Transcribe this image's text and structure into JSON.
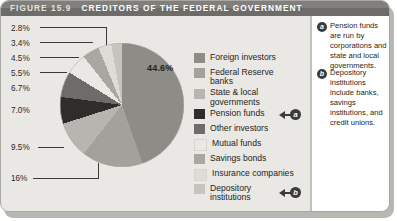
{
  "figure": {
    "label": "FIGURE 15.9",
    "title": "CREDITORS OF THE FEDERAL GOVERNMENT",
    "source": "Source: U. S. Treasury Bulletin, December 2005"
  },
  "chart_data": {
    "type": "pie",
    "title": "CREDITORS OF THE FEDERAL GOVERNMENT",
    "legend_position": "right",
    "categories": [
      "Foreign investors",
      "Federal Reserve banks",
      "State & local governments",
      "Pension funds",
      "Other investors",
      "Mutual funds",
      "Savings bonds",
      "Insurance companies",
      "Depository institutions"
    ],
    "values": [
      44.6,
      16,
      9.5,
      7.0,
      6.7,
      5.5,
      4.5,
      3.4,
      2.8
    ],
    "value_labels": [
      "44.6%",
      "16%",
      "9.5%",
      "7.0%",
      "6.7%",
      "5.5%",
      "4.5%",
      "3.4%",
      "2.8%"
    ],
    "colors": [
      "#8e8c87",
      "#a3a19c",
      "#b7b5b0",
      "#2e2d2b",
      "#6e6c68",
      "#e9e8e4",
      "#a9a7a2",
      "#dedcd7",
      "#c6c4bf"
    ],
    "units": "percent"
  },
  "percent_labels": [
    {
      "text": "2.8%"
    },
    {
      "text": "3.4%"
    },
    {
      "text": "4.5%"
    },
    {
      "text": "5.5%"
    },
    {
      "text": "6.7%"
    },
    {
      "text": "7.0%"
    },
    {
      "text": "9.5%"
    },
    {
      "text": "16%"
    }
  ],
  "big_label": {
    "text": "44.6%"
  },
  "legend": {
    "items": [
      {
        "label": "Foreign investors",
        "color": "#8e8c87",
        "callout": ""
      },
      {
        "label": "Federal Reserve\nbanks",
        "color": "#a3a19c",
        "callout": ""
      },
      {
        "label": "State & local\ngovernments",
        "color": "#b7b5b0",
        "callout": ""
      },
      {
        "label": "Pension funds",
        "color": "#2e2d2b",
        "callout": "a"
      },
      {
        "label": "Other investors",
        "color": "#6e6c68",
        "callout": ""
      },
      {
        "label": "Mutual funds",
        "color": "#e9e8e4",
        "callout": ""
      },
      {
        "label": "Savings bonds",
        "color": "#a9a7a2",
        "callout": ""
      },
      {
        "label": "Insurance companies",
        "color": "#dedcd7",
        "callout": ""
      },
      {
        "label": "Depository\ninstitutions",
        "color": "#c6c4bf",
        "callout": "b"
      }
    ]
  },
  "notes": [
    {
      "marker": "a",
      "text": "Pension funds are run by corporations and state and local governments."
    },
    {
      "marker": "b",
      "text": "Depository institutions include banks, savings institutions, and credit unions."
    }
  ]
}
